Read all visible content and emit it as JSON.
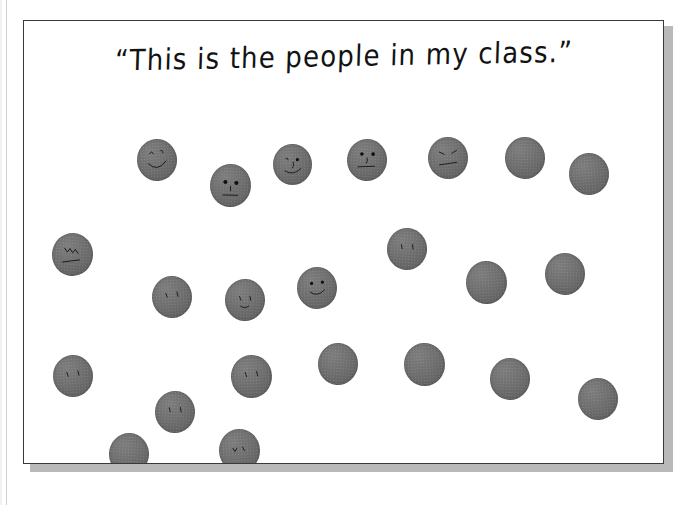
{
  "page": {
    "background_color": "#ffffff",
    "sheet_border_color": "#3a3a3a",
    "shadow_color": "#b9b9b9"
  },
  "title": {
    "text": "“This is the people in my class.”",
    "plain_text": "This is the people in my class.",
    "color": "#121212"
  },
  "dots": {
    "color": "#6e6e6e",
    "ink_color": "#101010",
    "total_count": 23,
    "with_faces_count": 13,
    "blank_count": 10,
    "rows": [
      {
        "label": "row-1",
        "count": 7
      },
      {
        "label": "row-2",
        "count": 7
      },
      {
        "label": "row-3",
        "count": 7
      },
      {
        "label": "row-4",
        "count": 2
      }
    ],
    "items": [
      {
        "id": 1,
        "row": 1,
        "x": 113,
        "y": 118,
        "size": 40,
        "rot": -4,
        "face": "smile-closed-eyes"
      },
      {
        "id": 2,
        "row": 1,
        "x": 186,
        "y": 143,
        "size": 41,
        "rot": 3,
        "face": "round-eyes-nose-line-mouth"
      },
      {
        "id": 3,
        "row": 1,
        "x": 249,
        "y": 123,
        "size": 39,
        "rot": -2,
        "face": "eyes-nose-smile"
      },
      {
        "id": 4,
        "row": 1,
        "x": 323,
        "y": 118,
        "size": 40,
        "rot": 5,
        "face": "eyes-nose-flat-mouth"
      },
      {
        "id": 5,
        "row": 1,
        "x": 404,
        "y": 116,
        "size": 40,
        "rot": -3,
        "face": "angled-brows-flat-mouth"
      },
      {
        "id": 6,
        "row": 1,
        "x": 481,
        "y": 116,
        "size": 40,
        "rot": 2,
        "face": "blank"
      },
      {
        "id": 7,
        "row": 1,
        "x": 545,
        "y": 132,
        "size": 40,
        "rot": -4,
        "face": "blank"
      },
      {
        "id": 8,
        "row": 2,
        "x": 28,
        "y": 212,
        "size": 41,
        "rot": 4,
        "face": "scribble-brows-slash-mouth"
      },
      {
        "id": 9,
        "row": 2,
        "x": 128,
        "y": 255,
        "size": 40,
        "rot": -3,
        "face": "two-tick-eyes"
      },
      {
        "id": 10,
        "row": 2,
        "x": 201,
        "y": 258,
        "size": 40,
        "rot": 3,
        "face": "tick-eyes-small-mouth"
      },
      {
        "id": 11,
        "row": 2,
        "x": 273,
        "y": 246,
        "size": 40,
        "rot": -2,
        "face": "eyes-smile"
      },
      {
        "id": 12,
        "row": 2,
        "x": 363,
        "y": 207,
        "size": 40,
        "rot": 4,
        "face": "two-tick-eyes"
      },
      {
        "id": 13,
        "row": 2,
        "x": 442,
        "y": 240,
        "size": 41,
        "rot": -3,
        "face": "blank"
      },
      {
        "id": 14,
        "row": 2,
        "x": 521,
        "y": 232,
        "size": 40,
        "rot": 2,
        "face": "blank"
      },
      {
        "id": 15,
        "row": 3,
        "x": 29,
        "y": 334,
        "size": 40,
        "rot": -4,
        "face": "two-tick-eyes"
      },
      {
        "id": 16,
        "row": 3,
        "x": 131,
        "y": 370,
        "size": 40,
        "rot": 3,
        "face": "two-tick-eyes"
      },
      {
        "id": 17,
        "row": 3,
        "x": 207,
        "y": 334,
        "size": 41,
        "rot": -2,
        "face": "two-tick-eyes"
      },
      {
        "id": 18,
        "row": 3,
        "x": 294,
        "y": 322,
        "size": 40,
        "rot": 4,
        "face": "blank"
      },
      {
        "id": 19,
        "row": 3,
        "x": 380,
        "y": 322,
        "size": 41,
        "rot": -3,
        "face": "blank"
      },
      {
        "id": 20,
        "row": 3,
        "x": 466,
        "y": 337,
        "size": 40,
        "rot": 2,
        "face": "blank"
      },
      {
        "id": 21,
        "row": 3,
        "x": 554,
        "y": 357,
        "size": 40,
        "rot": -4,
        "face": "blank"
      },
      {
        "id": 22,
        "row": 4,
        "x": 85,
        "y": 412,
        "size": 40,
        "rot": 3,
        "face": "blank"
      },
      {
        "id": 23,
        "row": 4,
        "x": 195,
        "y": 408,
        "size": 41,
        "rot": -3,
        "face": "brow-squiggle"
      }
    ]
  }
}
